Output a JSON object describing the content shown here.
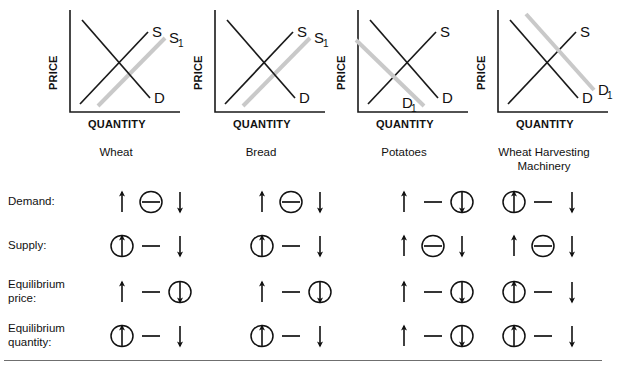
{
  "worksheet": {
    "title": "Supply and Demand Shift Summary",
    "axis": {
      "y_label": "PRICE",
      "x_label": "QUANTITY"
    },
    "colors": {
      "original_curve": "#1a1a1a",
      "shifted_curve": "#c9c9c9",
      "axis": "#1a1a1a",
      "divider": "#6f6f6f",
      "text": "#111111"
    },
    "symbols": {
      "up": "↑",
      "down": "↓",
      "no_change": "—",
      "circled_marker": "circle-selection"
    },
    "columns": [
      {
        "id": "wheat",
        "caption": "Wheat",
        "graph": {
          "curves": [
            {
              "name": "S",
              "label": "S",
              "type": "supply",
              "state": "original",
              "color": "#1a1a1a"
            },
            {
              "name": "S1",
              "label": "S",
              "sub": "1",
              "type": "supply",
              "state": "shifted",
              "color": "#c9c9c9",
              "direction": "right"
            },
            {
              "name": "D",
              "label": "D",
              "type": "demand",
              "state": "original",
              "color": "#1a1a1a"
            }
          ],
          "shift": "supply-increase"
        }
      },
      {
        "id": "bread",
        "caption": "Bread",
        "graph": {
          "curves": [
            {
              "name": "S",
              "label": "S",
              "type": "supply",
              "state": "original",
              "color": "#1a1a1a"
            },
            {
              "name": "S1",
              "label": "S",
              "sub": "1",
              "type": "supply",
              "state": "shifted",
              "color": "#c9c9c9",
              "direction": "right"
            },
            {
              "name": "D",
              "label": "D",
              "type": "demand",
              "state": "original",
              "color": "#1a1a1a"
            }
          ],
          "shift": "supply-increase"
        }
      },
      {
        "id": "potatoes",
        "caption": "Potatoes",
        "graph": {
          "curves": [
            {
              "name": "S",
              "label": "S",
              "type": "supply",
              "state": "original",
              "color": "#1a1a1a"
            },
            {
              "name": "D",
              "label": "D",
              "type": "demand",
              "state": "original",
              "color": "#1a1a1a"
            },
            {
              "name": "D1",
              "label": "D",
              "sub": "1",
              "type": "demand",
              "state": "shifted",
              "color": "#c9c9c9",
              "direction": "left"
            }
          ],
          "shift": "demand-decrease"
        }
      },
      {
        "id": "wheat-harvesting-machinery",
        "caption": "Wheat Harvesting Machinery",
        "caption_line1": "Wheat Harvesting",
        "caption_line2": "Machinery",
        "graph": {
          "curves": [
            {
              "name": "S",
              "label": "S",
              "type": "supply",
              "state": "original",
              "color": "#1a1a1a"
            },
            {
              "name": "D",
              "label": "D",
              "type": "demand",
              "state": "original",
              "color": "#1a1a1a"
            },
            {
              "name": "D1",
              "label": "D",
              "sub": "1",
              "type": "demand",
              "state": "shifted",
              "color": "#c9c9c9",
              "direction": "right"
            }
          ],
          "shift": "demand-increase"
        }
      }
    ],
    "rows": [
      {
        "id": "demand",
        "label": "Demand:",
        "label_line1": "Demand:",
        "label_line2": "",
        "answers": [
          {
            "column": "wheat",
            "options": [
              "up",
              "no_change",
              "down"
            ],
            "selected": "no_change"
          },
          {
            "column": "bread",
            "options": [
              "up",
              "no_change",
              "down"
            ],
            "selected": "no_change"
          },
          {
            "column": "potatoes",
            "options": [
              "up",
              "no_change",
              "down"
            ],
            "selected": "down"
          },
          {
            "column": "wheat-harvesting-machinery",
            "options": [
              "up",
              "no_change",
              "down"
            ],
            "selected": "up"
          }
        ]
      },
      {
        "id": "supply",
        "label": "Supply:",
        "label_line1": "Supply:",
        "label_line2": "",
        "answers": [
          {
            "column": "wheat",
            "options": [
              "up",
              "no_change",
              "down"
            ],
            "selected": "up"
          },
          {
            "column": "bread",
            "options": [
              "up",
              "no_change",
              "down"
            ],
            "selected": "up"
          },
          {
            "column": "potatoes",
            "options": [
              "up",
              "no_change",
              "down"
            ],
            "selected": "no_change"
          },
          {
            "column": "wheat-harvesting-machinery",
            "options": [
              "up",
              "no_change",
              "down"
            ],
            "selected": "no_change"
          }
        ]
      },
      {
        "id": "equilibrium-price",
        "label": "Equilibrium price:",
        "label_line1": "Equilibrium",
        "label_line2": "price:",
        "answers": [
          {
            "column": "wheat",
            "options": [
              "up",
              "no_change",
              "down"
            ],
            "selected": "down"
          },
          {
            "column": "bread",
            "options": [
              "up",
              "no_change",
              "down"
            ],
            "selected": "down"
          },
          {
            "column": "potatoes",
            "options": [
              "up",
              "no_change",
              "down"
            ],
            "selected": "down"
          },
          {
            "column": "wheat-harvesting-machinery",
            "options": [
              "up",
              "no_change",
              "down"
            ],
            "selected": "up"
          }
        ]
      },
      {
        "id": "equilibrium-quantity",
        "label": "Equilibrium quantity:",
        "label_line1": "Equilibrium",
        "label_line2": "quantity:",
        "answers": [
          {
            "column": "wheat",
            "options": [
              "up",
              "no_change",
              "down"
            ],
            "selected": "up"
          },
          {
            "column": "bread",
            "options": [
              "up",
              "no_change",
              "down"
            ],
            "selected": "up"
          },
          {
            "column": "potatoes",
            "options": [
              "up",
              "no_change",
              "down"
            ],
            "selected": "down"
          },
          {
            "column": "wheat-harvesting-machinery",
            "options": [
              "up",
              "no_change",
              "down"
            ],
            "selected": "up"
          }
        ]
      }
    ]
  }
}
